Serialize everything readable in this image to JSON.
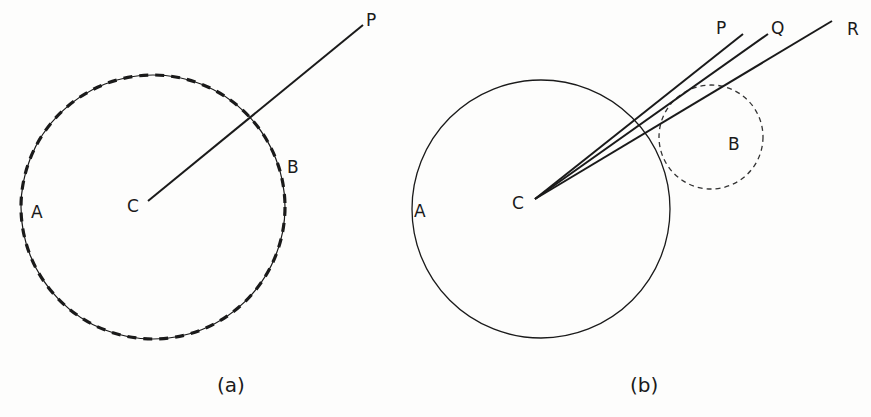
{
  "figure": {
    "type": "geometry-diagram",
    "background_color": "#fdfdfc",
    "ink_color": "#1a1a1a",
    "panels": [
      {
        "id": "a",
        "caption": "(a)",
        "circle": {
          "center": [
            153,
            207
          ],
          "radius": 132,
          "style": "thick-dashed"
        },
        "rays": [
          {
            "from_label": "C",
            "to_label": "P",
            "from": [
              148,
              201
            ],
            "to": [
              363,
              25
            ]
          }
        ],
        "labels": {
          "P": "P",
          "A": "A",
          "B": "B",
          "C": "C"
        }
      },
      {
        "id": "b",
        "caption": "(b)",
        "circle": {
          "center": [
            541,
            209
          ],
          "radius": 129,
          "style": "thin-solid"
        },
        "small_circle": {
          "label": "B",
          "center": [
            711,
            137
          ],
          "radius": 52,
          "style": "thin-dashed"
        },
        "rays": [
          {
            "from_label": "C",
            "to_label": "P",
            "from": [
              535,
              199
            ],
            "to": [
              743,
              34
            ]
          },
          {
            "from_label": "C",
            "to_label": "Q",
            "from": [
              535,
              199
            ],
            "to": [
              768,
              34
            ]
          },
          {
            "from_label": "C",
            "to_label": "R",
            "from": [
              535,
              199
            ],
            "to": [
              832,
              21
            ]
          }
        ],
        "labels": {
          "P": "P",
          "Q": "Q",
          "R": "R",
          "A": "A",
          "B": "B",
          "C": "C"
        }
      }
    ]
  }
}
